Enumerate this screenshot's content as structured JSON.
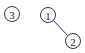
{
  "diagram": {
    "type": "graph",
    "nodes": [
      {
        "id": "3",
        "label": "3",
        "cx": 12,
        "cy": 14,
        "r": 7.5
      },
      {
        "id": "1",
        "label": "1",
        "cx": 48,
        "cy": 15,
        "r": 7.5
      },
      {
        "id": "2",
        "label": "2",
        "cx": 73,
        "cy": 41,
        "r": 7.5
      }
    ],
    "edges": [
      {
        "from": "1",
        "to": "2"
      }
    ],
    "colors": {
      "stroke": "#333333",
      "text": "#222222",
      "background": "#ffffff"
    }
  }
}
